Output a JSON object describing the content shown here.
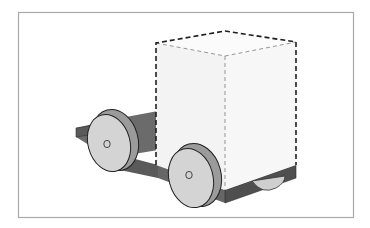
{
  "figure": {
    "description": "Isometric illustration of a toy cart: a flat dark-grey chassis with four wheels carrying a dashed-outline box (representing an invisible/transparent load).",
    "frame": {
      "stroke": "#a9a9a9"
    },
    "colors": {
      "background": "#ffffff",
      "chassis_top": "#6f6f6f",
      "chassis_side": "#555555",
      "chassis_shadow": "#4a4a4a",
      "wheel_face": "#d4d4d4",
      "wheel_rim": "#9b9b9b",
      "wheel_outline": "#222222",
      "box_front": "#f4f4f4",
      "box_side": "#f8f8f8",
      "box_top": "#fbfbfb",
      "box_dash_outer": "#1e1e1e",
      "box_dash_inner": "#8a8a8a"
    },
    "parts": [
      "chassis",
      "front-left-wheel",
      "front-right-wheel",
      "rear-right-wheel",
      "dashed-box"
    ]
  }
}
